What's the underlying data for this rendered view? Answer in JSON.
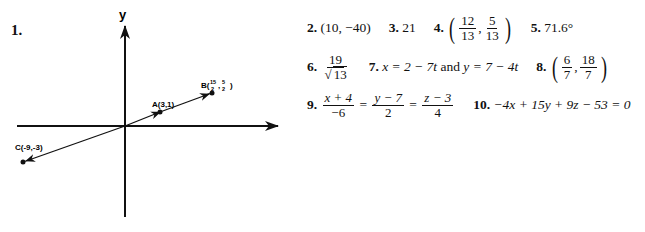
{
  "problem1": {
    "label": "1.",
    "axes": {
      "x_label": "x",
      "y_label": "y"
    },
    "points": [
      {
        "name": "A",
        "label": "A(3,1)"
      },
      {
        "name": "B",
        "label_prefix": "B(",
        "x_num": "15",
        "x_den": "2",
        "y_num": "5",
        "y_den": "2",
        "label_suffix": ")"
      },
      {
        "name": "C",
        "label": "C(-9,-3)"
      }
    ]
  },
  "answers": {
    "a2": {
      "num": "2.",
      "value": "(10, −40)"
    },
    "a3": {
      "num": "3.",
      "value": "21"
    },
    "a4": {
      "num": "4.",
      "x_num": "12",
      "x_den": "13",
      "y_num": "5",
      "y_den": "13"
    },
    "a5": {
      "num": "5.",
      "value": "71.6°"
    },
    "a6": {
      "num": "6.",
      "numerator": "19",
      "denominator": "13"
    },
    "a7": {
      "num": "7.",
      "part1": "x = 2 − 7t",
      "conj": "and",
      "part2": "y = 7 − 4t"
    },
    "a8": {
      "num": "8.",
      "x_num": "6",
      "x_den": "7",
      "y_num": "18",
      "y_den": "7"
    },
    "a9": {
      "num": "9.",
      "f1_num": "x + 4",
      "f1_den": "−6",
      "f2_num": "y − 7",
      "f2_den": "2",
      "f3_num": "z − 3",
      "f3_den": "4",
      "eq": "="
    },
    "a10": {
      "num": "10.",
      "value": "−4x + 15y + 9z − 53 = 0"
    }
  }
}
